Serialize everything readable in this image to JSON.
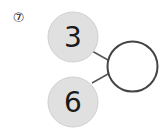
{
  "problem": {
    "number_label": "⑦",
    "top_value": "3",
    "bottom_value": "6",
    "answer_value": ""
  },
  "colors": {
    "filled_circle": "#e0e0e0",
    "filled_circle_border": "#cfcfcf",
    "answer_circle_border": "#444444",
    "line": "#555555",
    "text": "#1a1a1a"
  }
}
